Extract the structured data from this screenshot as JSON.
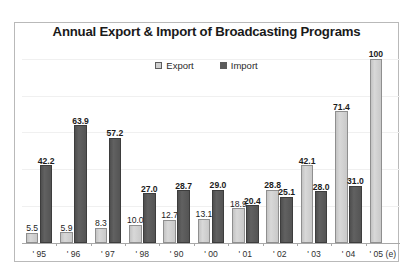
{
  "chart_data": {
    "type": "bar",
    "title": "Annual Export &  Import of Broadcasting Programs",
    "xlabel": "",
    "ylabel": "",
    "ylim": [
      0,
      108
    ],
    "grid": true,
    "legend_position": "top-center",
    "categories": [
      " ' 95",
      " ' 96",
      " ' 97",
      " ' 98",
      " ' 90",
      " ' 00",
      " ' 01",
      " ' 02",
      " ' 03",
      " ' 04",
      " ' 05 (e)"
    ],
    "series": [
      {
        "name": "Export",
        "color": "#cfcfcf",
        "values": [
          5.5,
          5.9,
          8.3,
          10.0,
          12.7,
          13.1,
          18.9,
          28.8,
          42.1,
          71.4,
          100
        ],
        "labels": [
          "5.5",
          "5.9",
          "8.3",
          "10.0",
          "12.7",
          "13.1",
          "18.9",
          "28.8",
          "42.1",
          "71.4",
          "100"
        ]
      },
      {
        "name": "Import",
        "color": "#5c5c5c",
        "values": [
          42.2,
          63.9,
          57.2,
          27.0,
          28.7,
          29.0,
          20.4,
          25.1,
          28.0,
          31.0,
          null
        ],
        "labels": [
          "42.2",
          "63.9",
          "57.2",
          "27.0",
          "28.7",
          "29.0",
          "20.4",
          "25.1",
          "28.0",
          "31.0",
          ""
        ]
      }
    ]
  },
  "legend": {
    "items": [
      {
        "label": "Export",
        "swatch": "export"
      },
      {
        "label": "Import",
        "swatch": "import"
      }
    ]
  },
  "colors": {
    "export_fill": "#cfcfcf",
    "import_fill": "#5c5c5c",
    "frame_border": "#b9b9b9",
    "axis": "#a8a8a8",
    "text": "#1a1a1a"
  }
}
